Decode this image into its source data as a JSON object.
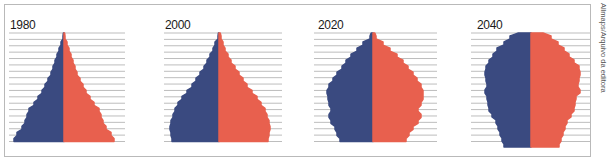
{
  "credit": "Allmaps/Arquivo da editora",
  "colors": {
    "male": "#3a4a80",
    "female": "#e8604e",
    "gridline": "#bdbdbd",
    "frame": "#b9b9b9"
  },
  "chart_data": [
    {
      "type": "area",
      "subtype": "population-pyramid",
      "title": "1980",
      "legend": [
        "male (left, blue)",
        "female (right, red)"
      ],
      "age_bands": 18,
      "grid": true,
      "axis_labels": "none shown",
      "note": "relative half-widths per age band, bottom (youngest) to top (oldest), 0-50 scale",
      "male": [
        50,
        47,
        42,
        39,
        37,
        35,
        30,
        26,
        22,
        19,
        16,
        13,
        11,
        9,
        7,
        5,
        3,
        1
      ],
      "female": [
        50,
        47,
        42,
        39,
        37,
        35,
        30,
        26,
        22,
        19,
        16,
        13,
        11,
        9,
        7,
        5,
        3,
        1
      ]
    },
    {
      "type": "area",
      "subtype": "population-pyramid",
      "title": "2000",
      "legend": [
        "male (left, blue)",
        "female (right, red)"
      ],
      "age_bands": 18,
      "grid": true,
      "male": [
        47,
        48,
        49,
        48,
        46,
        44,
        41,
        37,
        32,
        27,
        23,
        19,
        15,
        12,
        9,
        6,
        4,
        1
      ],
      "female": [
        49,
        50,
        51,
        50,
        48,
        46,
        42,
        38,
        33,
        28,
        24,
        20,
        16,
        12,
        9,
        6,
        4,
        2
      ]
    },
    {
      "type": "area",
      "subtype": "population-pyramid",
      "title": "2020",
      "legend": [
        "male (left, blue)",
        "female (right, red)"
      ],
      "age_bands": 18,
      "grid": true,
      "male": [
        33,
        36,
        38,
        42,
        44,
        42,
        44,
        45,
        46,
        44,
        40,
        36,
        31,
        27,
        22,
        16,
        10,
        3
      ],
      "female": [
        33,
        36,
        40,
        45,
        48,
        45,
        48,
        50,
        50,
        48,
        44,
        40,
        35,
        30,
        24,
        17,
        10,
        3
      ]
    },
    {
      "type": "area",
      "subtype": "population-pyramid",
      "title": "2040",
      "legend": [
        "male (left, blue)",
        "female (right, red)"
      ],
      "age_bands": 19,
      "grid": true,
      "male": [
        27,
        29,
        31,
        33,
        35,
        39,
        42,
        43,
        44,
        46,
        44,
        45,
        46,
        45,
        42,
        38,
        34,
        27,
        21
      ],
      "female": [
        28,
        30,
        32,
        34,
        36,
        40,
        43,
        44,
        45,
        49,
        47,
        48,
        49,
        48,
        43,
        38,
        33,
        27,
        20
      ]
    }
  ],
  "panels": [
    {
      "year": "1980",
      "cx": 64,
      "gx1": 9,
      "gx2": 125
    },
    {
      "year": "2000",
      "cx": 219,
      "gx1": 164,
      "gx2": 282
    },
    {
      "year": "2020",
      "cx": 373,
      "gx1": 314,
      "gx2": 437
    },
    {
      "year": "2040",
      "cx": 531,
      "gx1": 471,
      "gx2": 590
    }
  ]
}
